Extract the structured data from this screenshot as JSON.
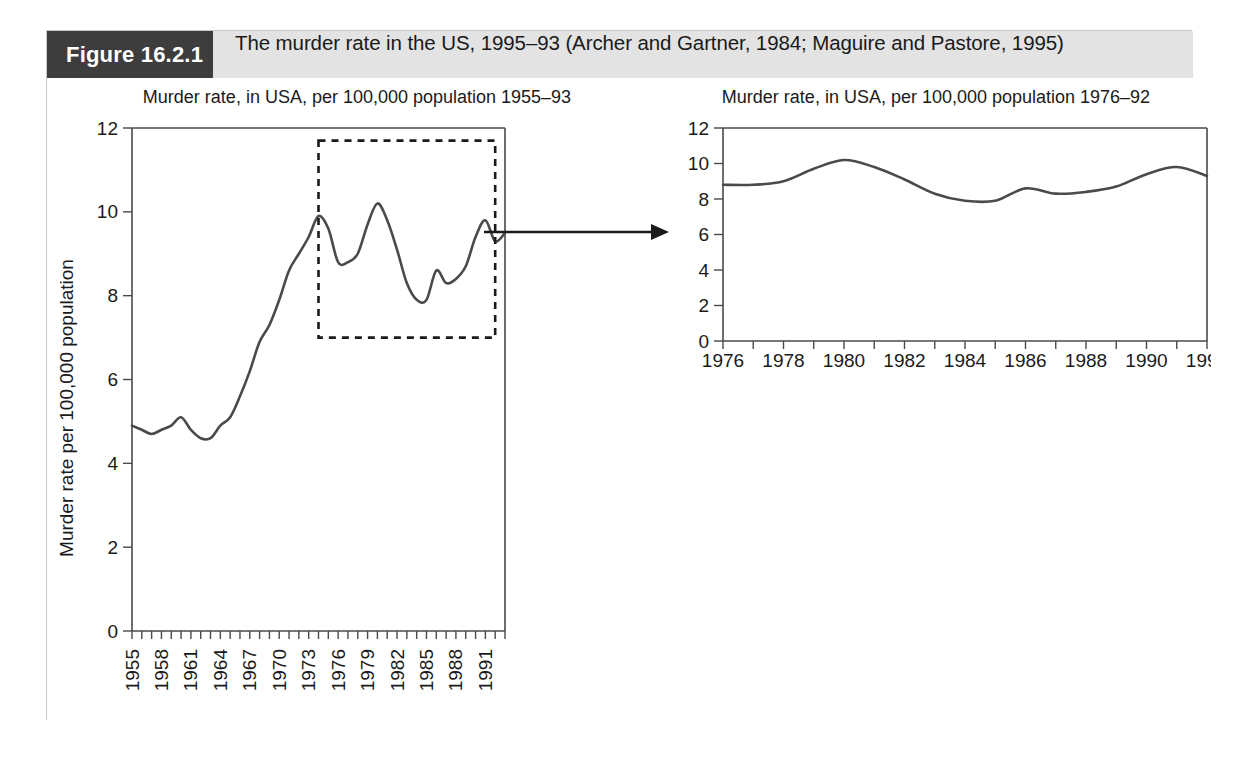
{
  "figure": {
    "number_label": "Figure 16.2.1",
    "caption": "The murder rate in the US, 1995–93 (Archer and Gartner, 1984; Maguire and Pastore, 1995)"
  },
  "chart_data": [
    {
      "id": "left",
      "type": "line",
      "title": "Murder rate, in USA, per 100,000 population 1955–93",
      "xlabel": "",
      "ylabel": "Murder rate per 100,000 population",
      "xlim": [
        1955,
        1993
      ],
      "ylim": [
        0,
        12
      ],
      "yticks": [
        0,
        2,
        4,
        6,
        8,
        10,
        12
      ],
      "ytick_labels": [
        "0",
        "2",
        "4",
        "6",
        "8",
        "10",
        "12"
      ],
      "xticks": [
        1955,
        1958,
        1961,
        1964,
        1967,
        1970,
        1973,
        1976,
        1979,
        1982,
        1985,
        1988,
        1991
      ],
      "xtick_labels": [
        "1955",
        "1958",
        "1961",
        "1964",
        "1967",
        "1970",
        "1973",
        "1976",
        "1979",
        "1982",
        "1985",
        "1988",
        "1991"
      ],
      "minor_xticks_every": 1,
      "grid": false,
      "legend": "none",
      "x": [
        1955,
        1956,
        1957,
        1958,
        1959,
        1960,
        1961,
        1962,
        1963,
        1964,
        1965,
        1966,
        1967,
        1968,
        1969,
        1970,
        1971,
        1972,
        1973,
        1974,
        1975,
        1976,
        1977,
        1978,
        1979,
        1980,
        1981,
        1982,
        1983,
        1984,
        1985,
        1986,
        1987,
        1988,
        1989,
        1990,
        1991,
        1992,
        1993
      ],
      "values": [
        4.9,
        4.8,
        4.7,
        4.8,
        4.9,
        5.1,
        4.8,
        4.6,
        4.6,
        4.9,
        5.1,
        5.6,
        6.2,
        6.9,
        7.3,
        7.9,
        8.6,
        9.0,
        9.4,
        9.9,
        9.6,
        8.8,
        8.8,
        9.0,
        9.7,
        10.2,
        9.8,
        9.1,
        8.3,
        7.9,
        7.9,
        8.6,
        8.3,
        8.4,
        8.7,
        9.4,
        9.8,
        9.3,
        9.5
      ],
      "highlight_box": {
        "x_start": 1974,
        "x_end": 1992,
        "y_start": 7.0,
        "y_end": 11.7,
        "style": "dashed"
      }
    },
    {
      "id": "right",
      "type": "line",
      "title": "Murder rate, in USA, per 100,000 population 1976–92",
      "xlabel": "",
      "ylabel": "",
      "xlim": [
        1976,
        1992
      ],
      "ylim": [
        0,
        12
      ],
      "yticks": [
        0,
        2,
        4,
        6,
        8,
        10,
        12
      ],
      "ytick_labels": [
        "0",
        "2",
        "4",
        "6",
        "8",
        "10",
        "12"
      ],
      "xticks": [
        1976,
        1978,
        1980,
        1982,
        1984,
        1986,
        1988,
        1990,
        1992
      ],
      "xtick_labels": [
        "1976",
        "1978",
        "1980",
        "1982",
        "1984",
        "1986",
        "1988",
        "1990",
        "1992"
      ],
      "minor_xticks_every": 1,
      "grid": false,
      "legend": "none",
      "x": [
        1976,
        1977,
        1978,
        1979,
        1980,
        1981,
        1982,
        1983,
        1984,
        1985,
        1986,
        1987,
        1988,
        1989,
        1990,
        1991,
        1992
      ],
      "values": [
        8.8,
        8.8,
        9.0,
        9.7,
        10.2,
        9.8,
        9.1,
        8.3,
        7.9,
        7.9,
        8.6,
        8.3,
        8.4,
        8.7,
        9.4,
        9.8,
        9.3
      ]
    }
  ],
  "annotations": {
    "arrow_label": "zoom-arrow"
  }
}
